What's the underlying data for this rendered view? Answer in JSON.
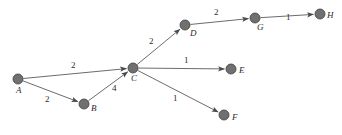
{
  "figure": {
    "name": "weighted-directed-graph",
    "width": 342,
    "height": 135,
    "background_color": "#ffffff",
    "node_color": "#707070",
    "node_stroke_color": "#3f3f3f",
    "edge_color": "#5a5a5a",
    "label_color": "#2b2b2b",
    "node_radius": 5
  },
  "chart_data": {
    "type": "diagram",
    "title": "",
    "graph_kind": "weighted directed graph",
    "nodes": [
      {
        "id": "A",
        "label": "A",
        "x": 18,
        "y": 79,
        "label_x": 16,
        "label_y": 86
      },
      {
        "id": "B",
        "label": "B",
        "x": 84,
        "y": 104,
        "label_x": 91,
        "label_y": 104
      },
      {
        "id": "C",
        "label": "C",
        "x": 133,
        "y": 68,
        "label_x": 131,
        "label_y": 74
      },
      {
        "id": "D",
        "label": "D",
        "x": 185,
        "y": 25,
        "label_x": 190,
        "label_y": 29
      },
      {
        "id": "E",
        "label": "E",
        "x": 231,
        "y": 69,
        "label_x": 239,
        "label_y": 66
      },
      {
        "id": "F",
        "label": "F",
        "x": 224,
        "y": 115,
        "label_x": 232,
        "label_y": 113
      },
      {
        "id": "G",
        "label": "G",
        "x": 255,
        "y": 18,
        "label_x": 257,
        "label_y": 23
      },
      {
        "id": "H",
        "label": "H",
        "x": 320,
        "y": 14,
        "label_x": 327,
        "label_y": 11
      }
    ],
    "edges": [
      {
        "from": "A",
        "to": "C",
        "weight": "2",
        "label_x": 71,
        "label_y": 61
      },
      {
        "from": "A",
        "to": "B",
        "weight": "2",
        "label_x": 45,
        "label_y": 95
      },
      {
        "from": "B",
        "to": "C",
        "weight": "4",
        "label_x": 112,
        "label_y": 84
      },
      {
        "from": "C",
        "to": "D",
        "weight": "2",
        "label_x": 149,
        "label_y": 37
      },
      {
        "from": "C",
        "to": "E",
        "weight": "1",
        "label_x": 184,
        "label_y": 56
      },
      {
        "from": "C",
        "to": "F",
        "weight": "1",
        "label_x": 173,
        "label_y": 94
      },
      {
        "from": "D",
        "to": "G",
        "weight": "2",
        "label_x": 214,
        "label_y": 8
      },
      {
        "from": "G",
        "to": "H",
        "weight": "1",
        "label_x": 286,
        "label_y": 13
      }
    ]
  }
}
